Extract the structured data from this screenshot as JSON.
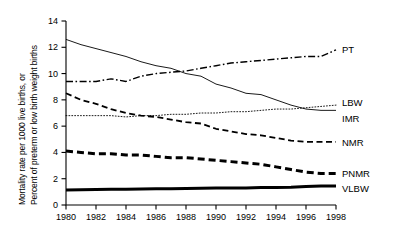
{
  "chart_data": {
    "type": "line",
    "title": "",
    "xlabel": "",
    "ylabel_line1": "Mortality rate per 1000 live births, or",
    "ylabel_line2": "Percent of preterm or low birth weight births",
    "x": [
      1980,
      1981,
      1982,
      1983,
      1984,
      1985,
      1986,
      1987,
      1988,
      1989,
      1990,
      1991,
      1992,
      1993,
      1994,
      1995,
      1996,
      1997,
      1998
    ],
    "xlim": [
      1980,
      1998
    ],
    "ylim": [
      0,
      14
    ],
    "xticks": [
      "1980",
      "1982",
      "1984",
      "1986",
      "1988",
      "1990",
      "1992",
      "1994",
      "1996",
      "1998"
    ],
    "xtick_values": [
      1980,
      1982,
      1984,
      1986,
      1988,
      1990,
      1992,
      1994,
      1996,
      1998
    ],
    "yticks": [
      "0",
      "2",
      "4",
      "6",
      "8",
      "10",
      "12",
      "14"
    ],
    "ytick_values": [
      0,
      2,
      4,
      6,
      8,
      10,
      12,
      14
    ],
    "grid": false,
    "legend_position": "right-inline",
    "series": [
      {
        "name": "PT",
        "label": "PT",
        "style": "dash-dot",
        "width": 1.4,
        "color": "#000000",
        "label_value": 11.9,
        "values": [
          9.4,
          9.4,
          9.4,
          9.6,
          9.4,
          9.8,
          10.0,
          10.1,
          10.2,
          10.4,
          10.6,
          10.8,
          10.9,
          11.0,
          11.1,
          11.2,
          11.3,
          11.3,
          11.8
        ]
      },
      {
        "name": "IMR",
        "label": "IMR",
        "style": "solid-thin",
        "width": 0.9,
        "color": "#000000",
        "label_value": 6.6,
        "values": [
          12.6,
          12.2,
          11.9,
          11.6,
          11.3,
          10.9,
          10.6,
          10.4,
          10.0,
          9.8,
          9.2,
          8.9,
          8.5,
          8.4,
          8.0,
          7.6,
          7.3,
          7.2,
          7.2
        ]
      },
      {
        "name": "LBW",
        "label": "LBW",
        "style": "dotted",
        "width": 0.9,
        "color": "#000000",
        "label_value": 7.6,
        "values": [
          6.8,
          6.8,
          6.8,
          6.8,
          6.7,
          6.8,
          6.8,
          6.9,
          6.9,
          7.0,
          7.0,
          7.1,
          7.1,
          7.2,
          7.3,
          7.3,
          7.4,
          7.5,
          7.6
        ]
      },
      {
        "name": "NMR",
        "label": "NMR",
        "style": "dashed",
        "width": 1.8,
        "color": "#000000",
        "label_value": 4.8,
        "values": [
          8.5,
          8.0,
          7.7,
          7.3,
          7.0,
          6.8,
          6.7,
          6.5,
          6.3,
          6.2,
          5.8,
          5.6,
          5.4,
          5.3,
          5.1,
          4.9,
          4.8,
          4.8,
          4.8
        ]
      },
      {
        "name": "PNMR",
        "label": "PNMR",
        "style": "dashed-thick",
        "width": 3.0,
        "color": "#000000",
        "label_value": 2.4,
        "values": [
          4.1,
          4.0,
          3.9,
          3.9,
          3.8,
          3.8,
          3.7,
          3.6,
          3.6,
          3.5,
          3.4,
          3.3,
          3.2,
          3.1,
          2.9,
          2.7,
          2.5,
          2.4,
          2.4
        ]
      },
      {
        "name": "VLBW",
        "label": "VLBW",
        "style": "solid-thick",
        "width": 3.0,
        "color": "#000000",
        "label_value": 1.3,
        "values": [
          1.15,
          1.16,
          1.18,
          1.19,
          1.2,
          1.21,
          1.23,
          1.24,
          1.26,
          1.27,
          1.3,
          1.3,
          1.3,
          1.33,
          1.33,
          1.35,
          1.41,
          1.44,
          1.45
        ]
      }
    ]
  },
  "legend": [
    {
      "label": "PT"
    },
    {
      "label": "LBW"
    },
    {
      "label": "IMR"
    },
    {
      "label": "NMR"
    },
    {
      "label": "PNMR"
    },
    {
      "label": "VLBW"
    }
  ]
}
